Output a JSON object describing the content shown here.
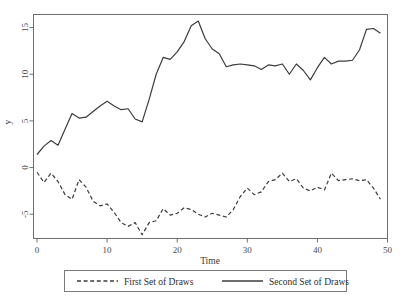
{
  "chart_data": {
    "type": "line",
    "title": "",
    "xlabel": "Time",
    "ylabel": "y",
    "xlim": [
      -0.5,
      50
    ],
    "ylim": [
      -7.6,
      16.4
    ],
    "grid": false,
    "legend_position": "bottom",
    "xticks": [
      0,
      10,
      20,
      30,
      40,
      50
    ],
    "yticks": [
      -5,
      0,
      5,
      10,
      15
    ],
    "x": [
      0,
      1,
      2,
      3,
      4,
      5,
      6,
      7,
      8,
      9,
      10,
      11,
      12,
      13,
      14,
      15,
      16,
      17,
      18,
      19,
      20,
      21,
      22,
      23,
      24,
      25,
      26,
      27,
      28,
      29,
      30,
      31,
      32,
      33,
      34,
      35,
      36,
      37,
      38,
      39,
      40,
      41,
      42,
      43,
      44,
      45,
      46,
      47,
      48,
      49
    ],
    "series": [
      {
        "name": "First Set of Draws",
        "style": "dashed",
        "color": "#3c3c3c",
        "values": [
          -0.5,
          -1.6,
          -0.6,
          -1.5,
          -2.9,
          -3.4,
          -1.3,
          -2.1,
          -3.6,
          -4.1,
          -3.9,
          -4.8,
          -5.9,
          -6.3,
          -5.9,
          -7.2,
          -5.9,
          -5.7,
          -4.4,
          -5.1,
          -4.9,
          -4.3,
          -4.5,
          -5.0,
          -5.3,
          -4.9,
          -5.1,
          -5.3,
          -4.5,
          -3.1,
          -2.2,
          -2.9,
          -2.6,
          -1.5,
          -1.3,
          -0.6,
          -1.5,
          -1.2,
          -2.2,
          -2.5,
          -2.1,
          -2.4,
          -0.6,
          -1.4,
          -1.3,
          -1.2,
          -1.4,
          -1.3,
          -2.2,
          -3.4
        ]
      },
      {
        "name": "Second Set of Draws",
        "style": "solid",
        "color": "#3c3c3c",
        "values": [
          1.4,
          2.3,
          2.9,
          2.4,
          4.1,
          5.8,
          5.3,
          5.4,
          6.0,
          6.6,
          7.1,
          6.6,
          6.2,
          6.3,
          5.2,
          4.9,
          7.3,
          10.0,
          11.8,
          11.6,
          12.4,
          13.5,
          15.2,
          15.7,
          13.8,
          12.7,
          12.2,
          10.8,
          11.0,
          11.1,
          11.0,
          10.9,
          10.5,
          11.0,
          10.9,
          11.1,
          10.0,
          11.1,
          10.4,
          9.4,
          10.7,
          11.8,
          11.1,
          11.4,
          11.4,
          11.5,
          12.6,
          14.8,
          14.9,
          14.4
        ]
      }
    ]
  },
  "axis": {
    "y_label": "y",
    "x_label": "Time",
    "y_tick_labels": [
      "15",
      "10",
      "5",
      "0",
      "-5"
    ],
    "x_tick_labels": [
      "0",
      "10",
      "20",
      "30",
      "40",
      "50"
    ]
  },
  "legend": {
    "entries": [
      {
        "label": "First Set of Draws",
        "style": "dashed"
      },
      {
        "label": "Second Set of Draws",
        "style": "solid"
      }
    ]
  }
}
